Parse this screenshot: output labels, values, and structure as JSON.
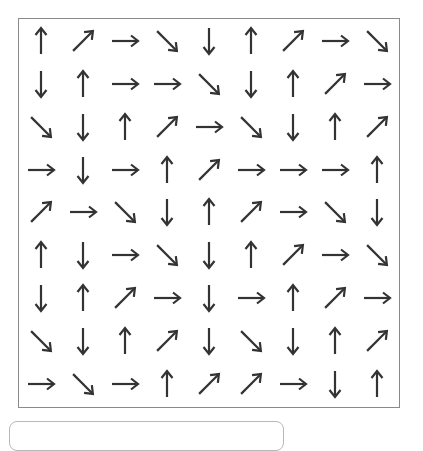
{
  "puzzle": {
    "rows": 9,
    "cols": 9,
    "arrow_color": "#333333",
    "border_color": "#8a8a8a",
    "grid": [
      [
        "up",
        "up-right",
        "right",
        "down-right",
        "down",
        "up",
        "up-right",
        "right",
        "down-right"
      ],
      [
        "down",
        "up",
        "right",
        "right",
        "down-right",
        "down",
        "up",
        "up-right",
        "right"
      ],
      [
        "down-right",
        "down",
        "up",
        "up-right",
        "right",
        "down-right",
        "down",
        "up",
        "up-right"
      ],
      [
        "right",
        "down",
        "right",
        "up",
        "up-right",
        "right",
        "right",
        "right",
        "up"
      ],
      [
        "up-right",
        "right",
        "down-right",
        "down",
        "up",
        "up-right",
        "right",
        "down-right",
        "down"
      ],
      [
        "up",
        "down",
        "right",
        "down-right",
        "down",
        "up",
        "up-right",
        "right",
        "down-right"
      ],
      [
        "down",
        "up",
        "up-right",
        "right",
        "down",
        "right",
        "up",
        "up-right",
        "right"
      ],
      [
        "down-right",
        "down",
        "up",
        "up-right",
        "down",
        "down-right",
        "down",
        "up",
        "up-right"
      ],
      [
        "right",
        "down-right",
        "right",
        "up",
        "up-right",
        "up-right",
        "right",
        "down",
        "up"
      ]
    ]
  },
  "answer_input": {
    "value": "",
    "placeholder": ""
  }
}
